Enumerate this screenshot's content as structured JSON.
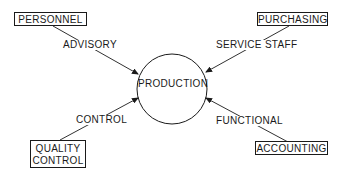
{
  "center": {
    "label": "PRODUCTION"
  },
  "nodes": {
    "personnel": {
      "label": "PERSONNEL",
      "relation": "ADVISORY"
    },
    "purchasing": {
      "label": "PURCHASING",
      "relation": "SERVICE STAFF"
    },
    "quality_control": {
      "label_line1": "QUALITY",
      "label_line2": "CONTROL",
      "relation": "CONTROL"
    },
    "accounting": {
      "label": "ACCOUNTING",
      "relation": "FUNCTIONAL"
    }
  },
  "colors": {
    "stroke": "#1a1a1a",
    "background": "#ffffff"
  }
}
